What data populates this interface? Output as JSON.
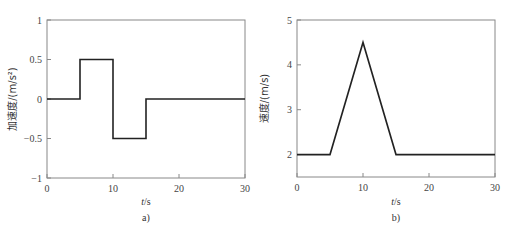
{
  "chart_data": [
    {
      "type": "line",
      "panel_label": "a)",
      "xlabel": "t/s",
      "ylabel": "加速度/(m/s²)",
      "xlim": [
        0,
        30
      ],
      "ylim": [
        -1,
        1
      ],
      "xticks": [
        "0",
        "10",
        "20",
        "30"
      ],
      "yticks": [
        "1",
        "0.5",
        "0",
        "-0.5",
        "-1"
      ],
      "grid": false,
      "series": [
        {
          "name": "acceleration",
          "x": [
            0,
            5,
            5,
            10,
            10,
            15,
            15,
            30
          ],
          "y": [
            0,
            0,
            0.5,
            0.5,
            -0.5,
            -0.5,
            0,
            0
          ]
        }
      ]
    },
    {
      "type": "line",
      "panel_label": "b)",
      "xlabel": "t/s",
      "ylabel": "速度/(m/s)",
      "xlim": [
        0,
        30
      ],
      "ylim": [
        1.5,
        5
      ],
      "xticks": [
        "0",
        "10",
        "20",
        "30"
      ],
      "yticks": [
        "5",
        "4",
        "3",
        "2"
      ],
      "grid": false,
      "series": [
        {
          "name": "velocity",
          "x": [
            0,
            5,
            10,
            15,
            30
          ],
          "y": [
            2,
            2,
            4.5,
            2,
            2
          ]
        }
      ]
    }
  ]
}
